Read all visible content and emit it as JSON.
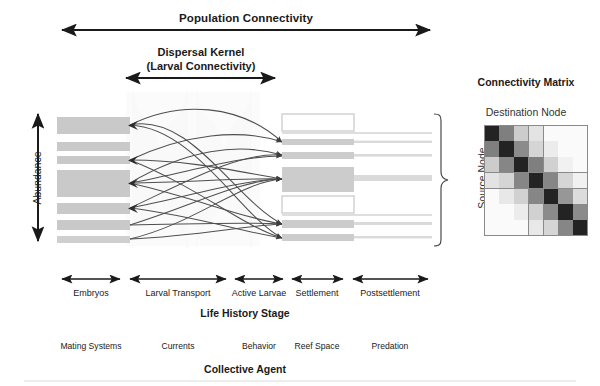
{
  "headings": {
    "population_connectivity": "Population Connectivity",
    "dispersal_kernel_line1": "Dispersal Kernel",
    "dispersal_kernel_line2": "(Larval Connectivity)",
    "connectivity_matrix": "Connectivity Matrix",
    "destination_node": "Destination Node",
    "source_node": "Source Node",
    "abundance": "Abundance",
    "life_history_stage": "Life History Stage",
    "collective_agent": "Collective Agent"
  },
  "life_history_stages": [
    {
      "label": "Embryos",
      "x_start": 60,
      "x_end": 122,
      "center": 91
    },
    {
      "label": "Larval Transport",
      "x_start": 128,
      "x_end": 228,
      "center": 178
    },
    {
      "label": "Active Larvae",
      "x_start": 233,
      "x_end": 285,
      "center": 259
    },
    {
      "label": "Settlement",
      "x_start": 290,
      "x_end": 345,
      "center": 317
    },
    {
      "label": "Postsettlement",
      "x_start": 351,
      "x_end": 430,
      "center": 390
    }
  ],
  "collective_agents": [
    {
      "label": "Mating Systems",
      "center": 91
    },
    {
      "label": "Currents",
      "center": 178
    },
    {
      "label": "Behavior",
      "center": 259
    },
    {
      "label": "Reef Space",
      "center": 317
    },
    {
      "label": "Predation",
      "center": 390
    }
  ],
  "arrows": {
    "population_connectivity": {
      "x_start": 60,
      "x_end": 432,
      "y": 30
    },
    "dispersal_kernel": {
      "x_start": 124,
      "x_end": 277,
      "y": 78
    },
    "abundance": {
      "x": 38,
      "y_start": 112,
      "y_end": 243
    }
  },
  "left_bars": [
    {
      "y": 117,
      "height": 17,
      "width": 73,
      "fill": "#c9c9c9"
    },
    {
      "y": 142,
      "height": 9,
      "width": 73,
      "fill": "#c9c9c9"
    },
    {
      "y": 156,
      "height": 8,
      "width": 73,
      "fill": "#c9c9c9"
    },
    {
      "y": 170,
      "height": 27,
      "width": 73,
      "fill": "#c9c9c9"
    },
    {
      "y": 203,
      "height": 11,
      "width": 73,
      "fill": "#c9c9c9"
    },
    {
      "y": 220,
      "height": 10,
      "width": 73,
      "fill": "#c9c9c9"
    },
    {
      "y": 236,
      "height": 7,
      "width": 73,
      "fill": "#cfcfcf"
    }
  ],
  "right_bars": [
    {
      "y": 114,
      "height": 17,
      "width": 72,
      "fill": "none",
      "stroke": "#cfcfcf",
      "outlined": true
    },
    {
      "y": 139,
      "height": 6,
      "width": 72,
      "fill": "#cccccc",
      "tail_width": 78,
      "outlined": false
    },
    {
      "y": 152,
      "height": 7,
      "width": 72,
      "fill": "#cccccc",
      "tail_width": 78,
      "outlined": false
    },
    {
      "y": 167,
      "height": 25,
      "width": 72,
      "fill": "#cccccc",
      "tail_width": 78,
      "outlined": false
    },
    {
      "y": 196,
      "height": 17,
      "width": 72,
      "fill": "none",
      "stroke": "#cfcfcf",
      "outlined": true
    },
    {
      "y": 220,
      "height": 8,
      "width": 72,
      "fill": "#cccccc",
      "tail_width": 78,
      "outlined": false
    },
    {
      "y": 234,
      "height": 7,
      "width": 72,
      "fill": "#cccccc",
      "tail_width": 78,
      "outlined": false
    }
  ],
  "chart_data": {
    "type": "heatmap",
    "title": "Connectivity Matrix",
    "xlabel": "Destination Node",
    "ylabel": "Source Node",
    "rows": 7,
    "cols": 7,
    "colorscale": "grayscale-dark-is-high",
    "values": [
      [
        0.95,
        0.55,
        0.22,
        0.12,
        0.02,
        0.02,
        0.02
      ],
      [
        0.55,
        0.95,
        0.5,
        0.18,
        0.08,
        0.02,
        0.02
      ],
      [
        0.22,
        0.52,
        0.95,
        0.55,
        0.2,
        0.06,
        0.02
      ],
      [
        0.12,
        0.18,
        0.52,
        0.95,
        0.52,
        0.18,
        0.06
      ],
      [
        0.02,
        0.1,
        0.2,
        0.52,
        0.95,
        0.45,
        0.15
      ],
      [
        0.02,
        0.02,
        0.08,
        0.2,
        0.5,
        0.95,
        0.5
      ],
      [
        0.02,
        0.02,
        0.02,
        0.1,
        0.18,
        0.52,
        0.95
      ]
    ]
  },
  "colors": {
    "bar_gray": "#c9c9c9",
    "matrix_dark": "#1c1c1c",
    "matrix_grid": "#8a8a8a",
    "arrow_black": "#1a1a1a",
    "link_gray": "#5a5a5a",
    "watermark": "#f1f1f1"
  },
  "links": [
    {
      "from": 0,
      "to": 3
    },
    {
      "from": 0,
      "to": 5
    },
    {
      "from": 0,
      "to": 6
    },
    {
      "from": 2,
      "to": 1
    },
    {
      "from": 2,
      "to": 4
    },
    {
      "from": 2,
      "to": 6
    },
    {
      "from": 3,
      "to": 1
    },
    {
      "from": 3,
      "to": 2
    },
    {
      "from": 3,
      "to": 3
    },
    {
      "from": 3,
      "to": 5
    },
    {
      "from": 4,
      "to": 2
    },
    {
      "from": 4,
      "to": 3
    },
    {
      "from": 4,
      "to": 6
    },
    {
      "from": 5,
      "to": 3
    },
    {
      "from": 5,
      "to": 5
    },
    {
      "from": 6,
      "to": 3
    },
    {
      "from": 6,
      "to": 5
    }
  ]
}
